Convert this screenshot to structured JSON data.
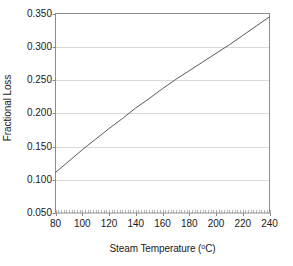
{
  "chart_data": {
    "type": "line",
    "title": "",
    "xlabel": "Steam Temperature (°C)",
    "xlabel_main": "Steam Temperature (",
    "xlabel_sup": "o",
    "xlabel_tail": "C)",
    "ylabel": "Fractional Loss",
    "xlim": [
      80,
      240
    ],
    "ylim": [
      0.05,
      0.35
    ],
    "xticks": [
      80,
      100,
      120,
      140,
      160,
      180,
      200,
      220,
      240
    ],
    "xtick_labels": [
      "80",
      "100",
      "120",
      "140",
      "160",
      "180",
      "200",
      "220",
      "240"
    ],
    "yticks": [
      0.05,
      0.1,
      0.15,
      0.2,
      0.25,
      0.3,
      0.35
    ],
    "ytick_labels": [
      "0.050",
      "0.100",
      "0.150",
      "0.200",
      "0.250",
      "0.300",
      "0.350"
    ],
    "grid": "horizontal",
    "minor_ticks_x": true,
    "legend": "none",
    "series": [
      {
        "name": "Fractional Loss",
        "color": "#5a5a5a",
        "x": [
          80,
          90,
          100,
          110,
          120,
          130,
          140,
          150,
          160,
          170,
          180,
          190,
          200,
          210,
          220,
          230,
          240
        ],
        "values": [
          0.111,
          0.128,
          0.145,
          0.161,
          0.177,
          0.192,
          0.208,
          0.222,
          0.237,
          0.251,
          0.264,
          0.277,
          0.29,
          0.303,
          0.317,
          0.331,
          0.345
        ]
      }
    ]
  },
  "axes": {
    "frame_color": "#8c8c8c",
    "grid_color": "#d9d9d9"
  }
}
